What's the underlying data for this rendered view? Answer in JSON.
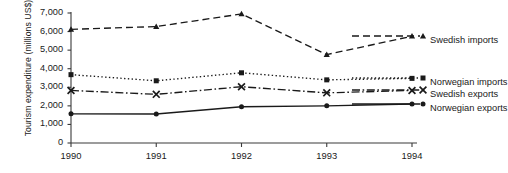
{
  "chart_data": {
    "type": "line",
    "title": "",
    "xlabel": "",
    "ylabel": "Tourism expenditure (millions US$)",
    "categories": [
      "1990",
      "1991",
      "1992",
      "1993",
      "1994"
    ],
    "x": [
      1990,
      1991,
      1992,
      1993,
      1994
    ],
    "ylim": [
      0,
      7000
    ],
    "yticks": [
      "0",
      "1,000",
      "2,000",
      "3,000",
      "4,000",
      "5,000",
      "6,000",
      "7,000"
    ],
    "ytick_values": [
      0,
      1000,
      2000,
      3000,
      4000,
      5000,
      6000,
      7000
    ],
    "grid": false,
    "legend_position": "right-inside",
    "series": [
      {
        "name": "Swedish imports",
        "marker": "triangle",
        "line_style": "dashed",
        "color": "#1a1a1a",
        "values": [
          6120,
          6270,
          6950,
          4760,
          5750
        ]
      },
      {
        "name": "Norwegian imports",
        "marker": "square",
        "line_style": "dotted",
        "color": "#1a1a1a",
        "values": [
          3680,
          3350,
          3780,
          3400,
          3480
        ]
      },
      {
        "name": "Swedish exports",
        "marker": "cross",
        "line_style": "dashdot",
        "color": "#1a1a1a",
        "values": [
          2830,
          2620,
          3030,
          2700,
          2830
        ]
      },
      {
        "name": "Norwegian exports",
        "marker": "circle",
        "line_style": "solid",
        "color": "#1a1a1a",
        "values": [
          1570,
          1560,
          1950,
          2000,
          2100
        ]
      }
    ]
  },
  "axis": {
    "line_color": "#3a3a3a"
  }
}
